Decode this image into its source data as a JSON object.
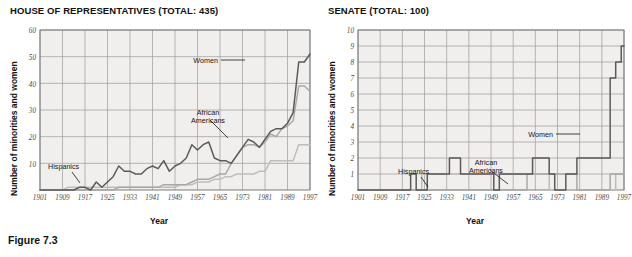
{
  "caption": "Figure 7.3",
  "panels": [
    {
      "id": "house",
      "title": "HOUSE OF REPRESENTATIVES (TOTAL: 435)",
      "ylabel": "Number of minorities and women",
      "xlabel": "Year",
      "annotations": {
        "women": "Women",
        "african_americans_line1": "African",
        "african_americans_line2": "Americans",
        "hispanics": "Hispanics"
      }
    },
    {
      "id": "senate",
      "title": "SENATE (TOTAL: 100)",
      "ylabel": "Number of minorities and women",
      "xlabel": "Year",
      "annotations": {
        "women": "Women",
        "african_americans_line1": "African",
        "african_americans_line2": "Americans",
        "hispanics": "Hispanics"
      }
    }
  ],
  "colors": {
    "women_line": "#5a5a5a",
    "african_americans_line": "#a8a8a8",
    "hispanics_line": "#bdbdbd",
    "grid": "#9b9b9b",
    "axis": "#6e6e6e",
    "plot_background": "#f0efed",
    "text": "#161616"
  },
  "chart_data": [
    {
      "type": "line",
      "title": "HOUSE OF REPRESENTATIVES (TOTAL: 435)",
      "xlabel": "Year",
      "ylabel": "Number of minorities and women",
      "xlim": [
        1901,
        1997
      ],
      "ylim": [
        0,
        60
      ],
      "xticks": [
        1901,
        1909,
        1917,
        1925,
        1933,
        1941,
        1949,
        1957,
        1965,
        1973,
        1981,
        1989,
        1997
      ],
      "yticks": [
        10,
        20,
        30,
        40,
        50,
        60
      ],
      "grid": true,
      "legend": "inline-annotations",
      "x": [
        1901,
        1903,
        1905,
        1907,
        1909,
        1911,
        1913,
        1915,
        1917,
        1919,
        1921,
        1923,
        1925,
        1927,
        1929,
        1931,
        1933,
        1935,
        1937,
        1939,
        1941,
        1943,
        1945,
        1947,
        1949,
        1951,
        1953,
        1955,
        1957,
        1959,
        1961,
        1963,
        1965,
        1967,
        1969,
        1971,
        1973,
        1975,
        1977,
        1979,
        1981,
        1983,
        1985,
        1987,
        1989,
        1991,
        1993,
        1995,
        1997
      ],
      "series": [
        {
          "name": "Women",
          "values": [
            0,
            0,
            0,
            0,
            0,
            0,
            0,
            1,
            1,
            0,
            3,
            1,
            3,
            5,
            9,
            7,
            7,
            6,
            6,
            8,
            9,
            8,
            11,
            7,
            9,
            10,
            12,
            17,
            15,
            17,
            18,
            12,
            11,
            11,
            10,
            13,
            16,
            19,
            18,
            16,
            19,
            22,
            23,
            23,
            25,
            29,
            48,
            48,
            51
          ]
        },
        {
          "name": "African Americans",
          "values": [
            0,
            0,
            0,
            0,
            0,
            0,
            0,
            0,
            0,
            0,
            0,
            0,
            0,
            0,
            1,
            1,
            1,
            1,
            1,
            1,
            1,
            1,
            2,
            2,
            2,
            2,
            2,
            3,
            4,
            4,
            4,
            5,
            6,
            6,
            10,
            13,
            16,
            17,
            17,
            16,
            18,
            21,
            20,
            23,
            24,
            26,
            39,
            39,
            37
          ]
        },
        {
          "name": "Hispanics",
          "values": [
            0,
            0,
            0,
            0,
            0,
            1,
            1,
            1,
            1,
            1,
            1,
            1,
            1,
            1,
            1,
            1,
            1,
            1,
            1,
            1,
            1,
            1,
            1,
            1,
            1,
            2,
            2,
            2,
            3,
            3,
            3,
            4,
            4,
            5,
            5,
            6,
            6,
            6,
            6,
            7,
            7,
            11,
            11,
            11,
            11,
            11,
            17,
            17,
            17
          ]
        }
      ]
    },
    {
      "type": "line",
      "title": "SENATE (TOTAL: 100)",
      "xlabel": "Year",
      "ylabel": "Number of minorities and women",
      "xlim": [
        1901,
        1997
      ],
      "ylim": [
        0,
        10
      ],
      "xticks": [
        1901,
        1909,
        1917,
        1925,
        1933,
        1941,
        1949,
        1957,
        1965,
        1973,
        1981,
        1989,
        1997
      ],
      "yticks": [
        1,
        2,
        3,
        4,
        5,
        6,
        7,
        8,
        9,
        10
      ],
      "grid": true,
      "legend": "inline-annotations",
      "x": [
        1901,
        1903,
        1905,
        1907,
        1909,
        1911,
        1913,
        1915,
        1917,
        1919,
        1921,
        1923,
        1925,
        1927,
        1929,
        1931,
        1933,
        1935,
        1937,
        1939,
        1941,
        1943,
        1945,
        1947,
        1949,
        1951,
        1953,
        1955,
        1957,
        1959,
        1961,
        1963,
        1965,
        1967,
        1969,
        1971,
        1973,
        1975,
        1977,
        1979,
        1981,
        1983,
        1985,
        1987,
        1989,
        1991,
        1993,
        1995,
        1997
      ],
      "series": [
        {
          "name": "Women",
          "values": [
            0,
            0,
            0,
            0,
            0,
            0,
            0,
            0,
            0,
            0,
            1,
            0,
            0,
            1,
            1,
            1,
            1,
            2,
            2,
            1,
            1,
            1,
            1,
            1,
            1,
            0,
            1,
            1,
            1,
            1,
            1,
            1,
            2,
            2,
            2,
            1,
            0,
            0,
            1,
            1,
            2,
            2,
            2,
            2,
            2,
            2,
            7,
            8,
            9
          ]
        },
        {
          "name": "African Americans",
          "values": [
            0,
            0,
            0,
            0,
            0,
            0,
            0,
            0,
            0,
            0,
            0,
            0,
            0,
            0,
            0,
            0,
            0,
            0,
            0,
            0,
            0,
            0,
            0,
            0,
            0,
            0,
            0,
            0,
            0,
            0,
            0,
            1,
            1,
            1,
            1,
            1,
            1,
            1,
            1,
            1,
            0,
            0,
            0,
            0,
            0,
            0,
            1,
            1,
            1
          ]
        },
        {
          "name": "Hispanics",
          "values": [
            0,
            0,
            0,
            0,
            0,
            0,
            0,
            0,
            0,
            0,
            0,
            0,
            1,
            1,
            1,
            1,
            1,
            1,
            1,
            1,
            1,
            1,
            1,
            1,
            1,
            1,
            1,
            1,
            1,
            1,
            1,
            1,
            1,
            1,
            1,
            0,
            0,
            0,
            0,
            0,
            0,
            0,
            0,
            0,
            0,
            0,
            0,
            1,
            1
          ]
        }
      ]
    }
  ]
}
